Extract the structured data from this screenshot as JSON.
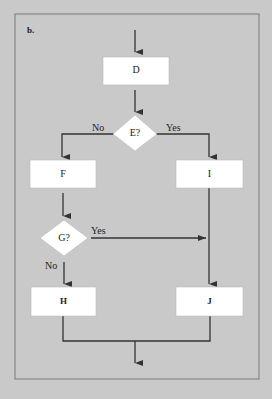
{
  "panel_label": "b.",
  "colors": {
    "background": "#c9c9c9",
    "box_fill": "#ffffff",
    "line": "#333333",
    "frame": "#7a7a7a"
  },
  "nodes": {
    "D": {
      "type": "process",
      "label": "D"
    },
    "E": {
      "type": "decision",
      "label": "E?"
    },
    "F": {
      "type": "process",
      "label": "F"
    },
    "I": {
      "type": "process",
      "label": "I"
    },
    "G": {
      "type": "decision",
      "label": "G?"
    },
    "H": {
      "type": "process",
      "label": "H"
    },
    "J": {
      "type": "process",
      "label": "J"
    }
  },
  "edge_labels": {
    "e_no": "No",
    "e_yes": "Yes",
    "g_yes": "Yes",
    "g_no": "No"
  },
  "edges": [
    {
      "from": "start",
      "to": "D"
    },
    {
      "from": "D",
      "to": "E"
    },
    {
      "from": "E",
      "to": "F",
      "label": "No"
    },
    {
      "from": "E",
      "to": "I",
      "label": "Yes"
    },
    {
      "from": "F",
      "to": "G"
    },
    {
      "from": "G",
      "to": "J",
      "label": "Yes"
    },
    {
      "from": "G",
      "to": "H",
      "label": "No"
    },
    {
      "from": "I",
      "to": "J"
    },
    {
      "from": "H",
      "to": "end"
    },
    {
      "from": "J",
      "to": "end"
    }
  ]
}
